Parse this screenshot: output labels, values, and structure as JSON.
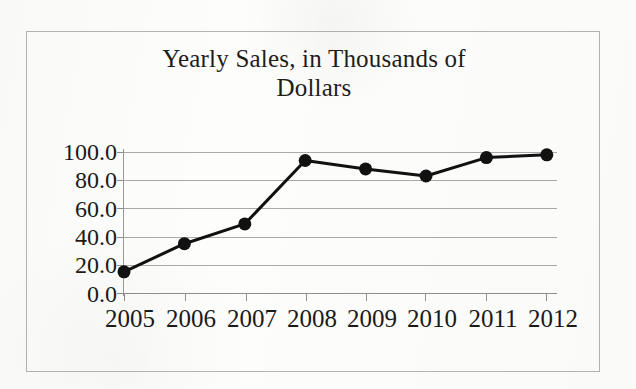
{
  "chart_data": {
    "type": "line",
    "title": "Yearly Sales, in Thousands of Dollars",
    "title_line1": "Yearly Sales, in Thousands of",
    "title_line2": "Dollars",
    "xlabel": "",
    "ylabel": "",
    "categories": [
      "2005",
      "2006",
      "2007",
      "2008",
      "2009",
      "2010",
      "2011",
      "2012"
    ],
    "values": [
      15,
      35,
      49,
      94,
      88,
      83,
      96,
      98
    ],
    "series": [
      {
        "name": "Yearly Sales",
        "values": [
          15,
          35,
          49,
          94,
          88,
          83,
          96,
          98
        ]
      }
    ],
    "ylim": [
      0,
      100
    ],
    "y_ticks": [
      "0.0",
      "20.0",
      "40.0",
      "60.0",
      "80.0",
      "100.0"
    ],
    "y_tick_values": [
      0,
      20,
      40,
      60,
      80,
      100
    ],
    "grid": true,
    "legend": false,
    "legend_position": "none",
    "marker": "filled-circle",
    "line_color": "#111111",
    "marker_color": "#111111",
    "grid_color": "#a9a9a9",
    "axis_color": "#8f8f8f",
    "text_color": "#1a1a1a",
    "background_color": "#fdfdfc",
    "frame_color": "#b4b4b4"
  }
}
